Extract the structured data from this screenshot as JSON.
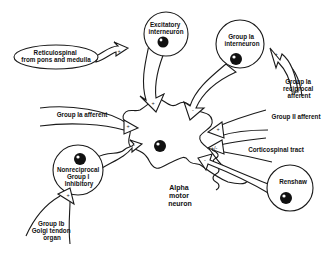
{
  "diagram": {
    "center_neuron": {
      "label_lines": [
        "Alpha",
        "motor",
        "neuron"
      ]
    },
    "interneurons": [
      {
        "id": "excitatory",
        "label_lines": [
          "Excitatory",
          "interneuron"
        ],
        "sign": "+"
      },
      {
        "id": "group-ia",
        "label_lines": [
          "Group Ia",
          "interneuron"
        ],
        "sign": "-"
      },
      {
        "id": "nonreciprocal",
        "label_lines": [
          "Nonreciprocal",
          "Group I",
          "Inhibitory"
        ],
        "sign": "-"
      },
      {
        "id": "renshaw",
        "label_lines": [
          "Renshaw"
        ],
        "sign": "-"
      }
    ],
    "inputs": [
      {
        "id": "reticulospinal",
        "label_lines": [
          "Reticulospinal",
          "from pons and medulla"
        ],
        "sign": "+"
      },
      {
        "id": "group-ia-afferent",
        "label_lines": [
          "Group Ia afferent"
        ],
        "sign": "+"
      },
      {
        "id": "group-ia-reciprocal",
        "label_lines": [
          "Group Ia",
          "reciprocal",
          "afferent"
        ],
        "sign": "+"
      },
      {
        "id": "group-ii-afferent",
        "label_lines": [
          "Group II afferent"
        ],
        "sign": "+"
      },
      {
        "id": "corticospinal",
        "label_lines": [
          "Corticospinal tract"
        ],
        "sign": "+/-"
      },
      {
        "id": "group-ib",
        "label_lines": [
          "Group Ib",
          "Golgi tendon",
          "organ"
        ],
        "sign": "+"
      }
    ],
    "colors": {
      "ink": "#1a1a1a",
      "background": "#ffffff"
    }
  }
}
